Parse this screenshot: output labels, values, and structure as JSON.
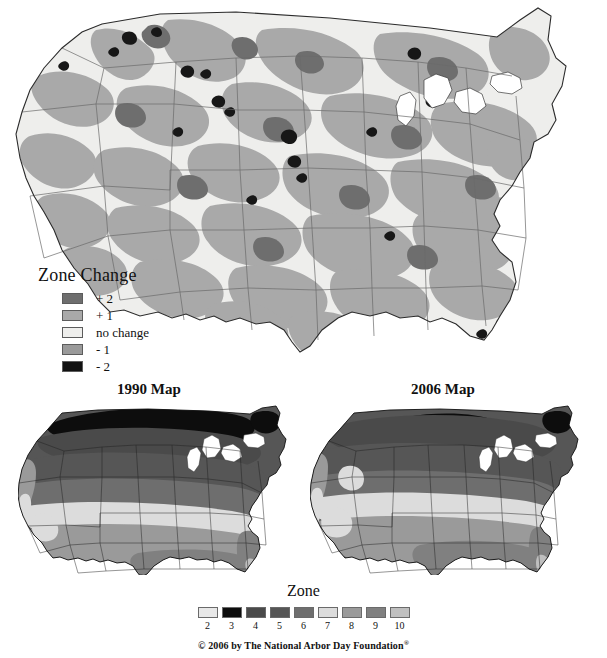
{
  "top_map": {
    "name": "us-zone-change-map",
    "description": "United States map showing USDA hardiness zone change between 1990 and 2006",
    "fill_no_change": "#eeeeec",
    "fill_plus1": "#a9a9a9",
    "fill_plus2": "#6e6e6e",
    "fill_minus1": "#9a9a9a",
    "fill_minus2": "#1a1a1a",
    "border_color": "#555555",
    "outline_color": "#2b2b2b"
  },
  "zone_change_legend": {
    "title": "Zone Change",
    "items": [
      {
        "label": "+ 2",
        "color": "#6e6e6e"
      },
      {
        "label": "+ 1",
        "color": "#a9a9a9"
      },
      {
        "label": "no change",
        "color": "#eeeeec"
      },
      {
        "label": "- 1",
        "color": "#9a9a9a"
      },
      {
        "label": "- 2",
        "color": "#111111"
      }
    ]
  },
  "submaps": [
    {
      "title": "1990 Map",
      "id": "map-1990"
    },
    {
      "title": "2006 Map",
      "id": "map-2006"
    }
  ],
  "zone_legend": {
    "title": "Zone",
    "zones": [
      {
        "number": "2",
        "color": "#e8e8e8"
      },
      {
        "number": "3",
        "color": "#0d0d0d"
      },
      {
        "number": "4",
        "color": "#4a4a4a"
      },
      {
        "number": "5",
        "color": "#565656"
      },
      {
        "number": "6",
        "color": "#6e6e6e"
      },
      {
        "number": "7",
        "color": "#dcdcdc"
      },
      {
        "number": "8",
        "color": "#9a9a9a"
      },
      {
        "number": "9",
        "color": "#808080"
      },
      {
        "number": "10",
        "color": "#bfbfbf"
      }
    ]
  },
  "copyright": {
    "text": "© 2006 by The National Arbor Day Foundation",
    "mark": "®"
  }
}
